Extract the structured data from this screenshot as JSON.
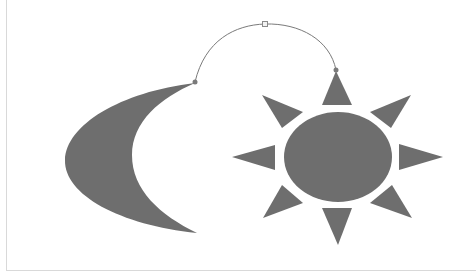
{
  "diagram": {
    "background": "#ffffff",
    "frame_color": "#d9d9d9",
    "shape_fill": "#6e6e6e",
    "connector_color": "#7a7a7a",
    "handle_fill": "#f2f2f2",
    "handle_stroke": "#8a8a8a",
    "shapes": [
      {
        "name": "moon",
        "type": "crescent"
      },
      {
        "name": "sun",
        "type": "sun",
        "rays": 8
      }
    ],
    "connector": {
      "type": "curved-arc",
      "start": [
        195,
        82
      ],
      "control_handle": [
        265,
        25
      ],
      "end": [
        336,
        70
      ]
    }
  }
}
